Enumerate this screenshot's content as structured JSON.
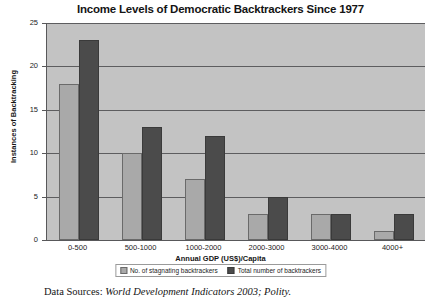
{
  "chart_data": {
    "type": "bar",
    "title": "Income Levels of Democratic Backtrackers Since 1977",
    "xlabel": "Annual GDP (US$)/Capita",
    "ylabel": "Instances of Backtracking",
    "categories": [
      "0-500",
      "500-1000",
      "1000-2000",
      "2000-3000",
      "3000-4000",
      "4000+"
    ],
    "series": [
      {
        "name": "No. of stagnating backtrackers",
        "color": "#a9a9a9",
        "values": [
          18,
          10,
          7,
          3,
          3,
          1
        ]
      },
      {
        "name": "Total number of backtrackers",
        "color": "#4b4b4b",
        "values": [
          23,
          13,
          12,
          5,
          3,
          3
        ]
      }
    ],
    "ylim": [
      0,
      25
    ],
    "yticks": [
      0,
      5,
      10,
      15,
      20,
      25
    ],
    "ytick_labels": [
      "0",
      "5",
      "10",
      "15",
      "20",
      "25"
    ],
    "grid": "horizontal",
    "legend_position": "bottom",
    "plot_background": "#c3c3c3"
  },
  "source_note": {
    "prefix": "Data Sources:",
    "italic": "World Development Indicators 2003; Polity."
  }
}
